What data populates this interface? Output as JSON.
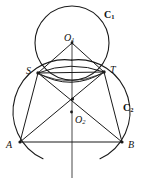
{
  "figure": {
    "kind": "geometry-diagram",
    "stroke_color": "#1a1a1a",
    "background_color": "#ffffff",
    "width": 151,
    "height": 188
  },
  "labels": {
    "circle_upper": {
      "text": "C",
      "sub": "1",
      "x": 104,
      "y": 10
    },
    "circle_lower": {
      "text": "C",
      "sub": "2",
      "x": 123,
      "y": 103
    },
    "center_upper": {
      "text": "O",
      "sub": "1",
      "x": 64,
      "y": 33
    },
    "center_lower": {
      "text": "O",
      "sub": "2",
      "x": 75,
      "y": 115
    },
    "point_s": {
      "text": "S",
      "x": 26,
      "y": 66
    },
    "point_t": {
      "text": "T",
      "x": 110,
      "y": 65
    },
    "point_a": {
      "text": "A",
      "x": 6,
      "y": 140
    },
    "point_b": {
      "text": "B",
      "x": 128,
      "y": 140
    }
  },
  "points": {
    "O1": {
      "x": 72,
      "y": 43
    },
    "O2": {
      "x": 71.5,
      "y": 112
    },
    "S": {
      "x": 38,
      "y": 73
    },
    "T": {
      "x": 104,
      "y": 72
    },
    "A": {
      "x": 20,
      "y": 142
    },
    "B": {
      "x": 122,
      "y": 142
    },
    "X": {
      "x": 72.5,
      "y": 99
    }
  },
  "circles": {
    "C1": {
      "cx": 72,
      "cy": 43,
      "r": 37
    },
    "C2": {
      "cx": 71.5,
      "cy": 112,
      "r": 52
    }
  },
  "segments": [
    {
      "name": "O1-S",
      "from": "O1",
      "to": "S"
    },
    {
      "name": "O1-T",
      "from": "O1",
      "to": "T"
    },
    {
      "name": "S-T",
      "from": "S",
      "to": "T"
    },
    {
      "name": "S-A",
      "from": "S",
      "to": "A"
    },
    {
      "name": "T-B",
      "from": "T",
      "to": "B"
    },
    {
      "name": "S-B",
      "from": "S",
      "to": "B"
    },
    {
      "name": "T-A",
      "from": "T",
      "to": "A"
    },
    {
      "name": "A-B",
      "from": "A",
      "to": "B"
    }
  ],
  "axis": {
    "name": "vertical-axis",
    "x": 72,
    "y_top": 40,
    "y_bottom": 178
  }
}
